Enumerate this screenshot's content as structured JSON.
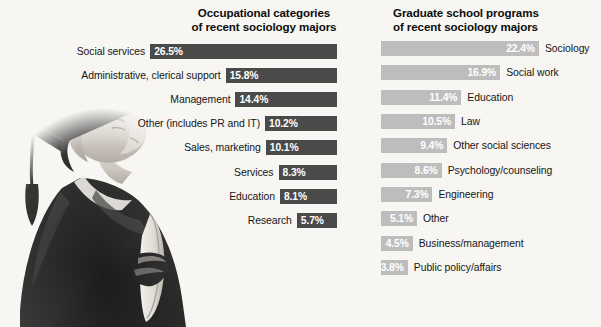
{
  "background_color": "#f7f6f3",
  "photo": {
    "alt_name": "graduate-photo",
    "description": "Black and white photograph of a graduate in cap and gown looking upward holding a rolled diploma"
  },
  "chart_data": [
    {
      "type": "bar",
      "orientation": "horizontal",
      "id": "occupational-categories",
      "title": "Occupational categories\nof recent sociology majors",
      "title_line1": "Occupational categories",
      "title_line2": "of recent sociology majors",
      "xlabel": "",
      "ylabel": "",
      "grid": false,
      "legend": "none",
      "bar_color": "#4a4a4a",
      "value_label_color": "#ffffff",
      "align": "right",
      "axis_max": 26.5,
      "categories": [
        "Social services",
        "Administrative, clerical support",
        "Management",
        "Other (includes PR and IT)",
        "Sales, marketing",
        "Services",
        "Education",
        "Research"
      ],
      "values": [
        26.5,
        15.8,
        14.4,
        10.2,
        10.1,
        8.3,
        8.1,
        5.7
      ],
      "value_labels": [
        "26.5%",
        "15.8%",
        "14.4%",
        "10.2%",
        "10.1%",
        "8.3%",
        "8.1%",
        "5.7%"
      ]
    },
    {
      "type": "bar",
      "orientation": "horizontal",
      "id": "graduate-school-programs",
      "title": "Graduate school programs\nof recent sociology majors",
      "title_line1": "Graduate school programs",
      "title_line2": "of recent sociology majors",
      "xlabel": "",
      "ylabel": "",
      "grid": false,
      "legend": "none",
      "bar_color": "#bdbdbd",
      "value_label_color": "#ffffff",
      "align": "left",
      "axis_max": 22.4,
      "categories": [
        "Sociology",
        "Social work",
        "Education",
        "Law",
        "Other social sciences",
        "Psychology/counseling",
        "Engineering",
        "Other",
        "Business/management",
        "Public policy/affairs"
      ],
      "values": [
        22.4,
        16.9,
        11.4,
        10.5,
        9.4,
        8.6,
        7.3,
        5.1,
        4.5,
        3.8
      ],
      "value_labels": [
        "22.4%",
        "16.9%",
        "11.4%",
        "10.5%",
        "9.4%",
        "8.6%",
        "7.3%",
        "5.1%",
        "4.5%",
        "3.8%"
      ]
    }
  ]
}
